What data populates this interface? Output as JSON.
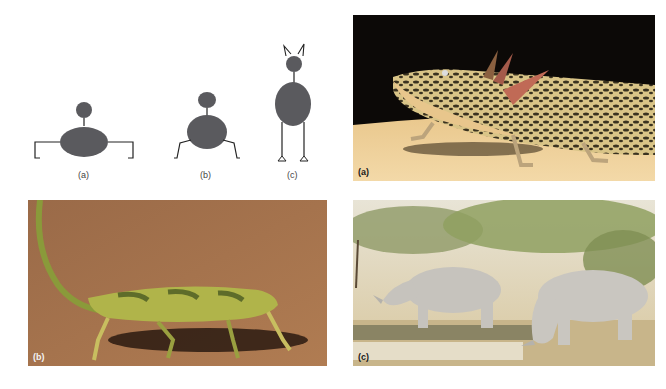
{
  "figure": {
    "diagram": {
      "panels": [
        {
          "id": "a",
          "caption": "(a)",
          "posture": "sprawling"
        },
        {
          "id": "b",
          "caption": "(b)",
          "posture": "semi-erect"
        },
        {
          "id": "c",
          "caption": "(c)",
          "posture": "erect"
        }
      ],
      "fill_color": "#5a5a5e",
      "line_color": "#222222"
    },
    "photos": [
      {
        "id": "a",
        "label": "(a)",
        "subject": "axolotl",
        "label_color": "#1a1a1a"
      },
      {
        "id": "b",
        "label": "(b)",
        "subject": "chameleon",
        "label_color": "#f2f2f2"
      },
      {
        "id": "c",
        "label": "(c)",
        "subject": "white rhinoceroses",
        "label_color": "#1a1a1a"
      }
    ]
  }
}
